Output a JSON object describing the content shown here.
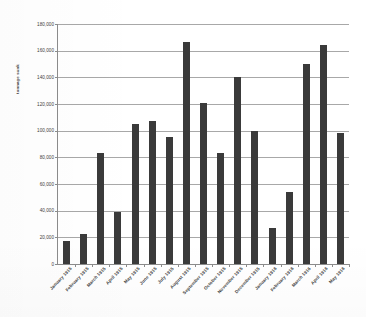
{
  "chart_data": {
    "type": "bar",
    "title": "",
    "subtitle": "",
    "xlabel": "",
    "ylabel": "tonnage sunk",
    "ylim": [
      0,
      180000
    ],
    "ytick_step": 20000,
    "grid": true,
    "legend": "none",
    "bar_color": "#3a3a3a",
    "axis_color": "#8c8c8c",
    "gridline_color": "#a8a8a8",
    "ytick_labels": [
      "180,000",
      "160,000",
      "140,000",
      "120,000",
      "100,000",
      "80,000",
      "60,000",
      "40,000",
      "20,000",
      "0"
    ],
    "ytick_values": [
      180000,
      160000,
      140000,
      120000,
      100000,
      80000,
      60000,
      40000,
      20000,
      0
    ],
    "categories": [
      "January 1915",
      "February 1915",
      "March 1915",
      "April 1915",
      "May 1915",
      "June 1915",
      "July 1915",
      "August 1915",
      "September 1915",
      "October 1915",
      "November 1915",
      "December 1915",
      "January 1916",
      "February 1916",
      "March 1916",
      "April 1916",
      "May 1916"
    ],
    "values": [
      17000,
      22500,
      83000,
      39000,
      105000,
      107000,
      95000,
      166500,
      121000,
      83000,
      140000,
      100000,
      27000,
      54000,
      150000,
      164000,
      98000
    ]
  }
}
